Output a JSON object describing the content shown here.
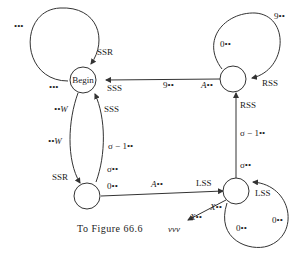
{
  "diagram": {
    "type": "state-transition",
    "nodes": [
      {
        "id": "begin",
        "label": "Begin"
      },
      {
        "id": "top-right",
        "label": ""
      },
      {
        "id": "bottom-left",
        "label": ""
      },
      {
        "id": "bottom-right",
        "label": ""
      }
    ],
    "labels": {
      "begin_loop_top_dots": "•••",
      "begin_loop_bottom_dots": "•••",
      "begin_loop_ssr": "SSR",
      "begin_in_sss": "SSS",
      "begin_up_sss": "SSS",
      "left_w1": "••W",
      "left_w2": "••W",
      "left_ssr": "SSR",
      "sigma_minus_1_left": "σ − 1••",
      "sigma_left": "σ••",
      "zero_left": "0••",
      "a_bottom": "A••",
      "lss_bottom": "LSS",
      "nine_top": "9••",
      "a_top": "A••",
      "tr_loop_nine": "9••",
      "tr_loop_zero": "0••",
      "tr_loop_rss": "RSS",
      "rss_vertical": "RSS",
      "sigma_minus_1_right": "σ − 1••",
      "sigma_right": "σ••",
      "br_loop_lss": "LSS",
      "br_loop_x": "X••",
      "br_loop_zero1": "0••",
      "br_loop_zero2": "0••",
      "out_x": "X••",
      "out_vvv": "vvv"
    },
    "caption": "To Figure 66.6"
  }
}
